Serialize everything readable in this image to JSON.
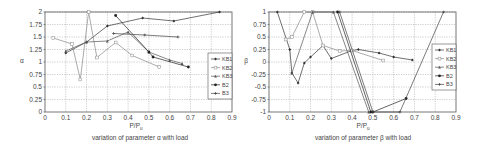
{
  "chart_data": [
    {
      "type": "line",
      "title": "variation of parameter α with load",
      "xlabel": "P/Pu",
      "ylabel": "α",
      "xlim": [
        0,
        0.9
      ],
      "ylim": [
        0,
        2
      ],
      "xticks": [
        "0",
        "0.1",
        "0.2",
        "0.3",
        "0.4",
        "0.5",
        "0.6",
        "0.7",
        "0.8",
        "0.9"
      ],
      "yticks": [
        "0",
        "0.25",
        "0.5",
        "0.75",
        "1",
        "1.25",
        "1.5",
        "1.75",
        "2"
      ],
      "grid": true,
      "legend_position": "right",
      "series": [
        {
          "name": "KB1",
          "color": "#333333",
          "points": [
            [
              0.1,
              1.18
            ],
            [
              0.2,
              1.4
            ],
            [
              0.3,
              1.72
            ],
            [
              0.47,
              1.88
            ],
            [
              0.62,
              1.82
            ],
            [
              0.84,
              2.0
            ]
          ]
        },
        {
          "name": "KB2",
          "color": "#888888",
          "points": [
            [
              0.04,
              1.48
            ],
            [
              0.13,
              1.36
            ],
            [
              0.17,
              0.65
            ],
            [
              0.21,
              2.0
            ],
            [
              0.25,
              1.09
            ],
            [
              0.34,
              1.39
            ],
            [
              0.42,
              1.13
            ],
            [
              0.55,
              0.9
            ]
          ]
        },
        {
          "name": "KB3",
          "color": "#555555",
          "points": [
            [
              0.1,
              1.22
            ],
            [
              0.2,
              1.4
            ],
            [
              0.3,
              1.42
            ],
            [
              0.4,
              1.6
            ],
            [
              0.5,
              1.2
            ],
            [
              0.6,
              1.04
            ],
            [
              0.66,
              0.97
            ]
          ]
        },
        {
          "name": "B2",
          "color": "#222222",
          "points": [
            [
              0.34,
              1.93
            ],
            [
              0.5,
              1.2
            ],
            [
              0.52,
              1.1
            ],
            [
              0.69,
              0.9
            ]
          ]
        },
        {
          "name": "B3",
          "color": "#444444",
          "points": [
            [
              0.33,
              1.57
            ],
            [
              0.48,
              1.54
            ],
            [
              0.64,
              1.5
            ]
          ]
        }
      ]
    },
    {
      "type": "line",
      "title": "variation of parameter β with load",
      "xlabel": "P/Pu",
      "ylabel": "β",
      "xlim": [
        0,
        0.9
      ],
      "ylim": [
        -1,
        1
      ],
      "xticks": [
        "0",
        "0.1",
        "0.2",
        "0.3",
        "0.4",
        "0.5",
        "0.6",
        "0.7",
        "0.8",
        "0.9"
      ],
      "yticks": [
        "-1",
        "-0.75",
        "-0.5",
        "-0.25",
        "0",
        "0.25",
        "0.5",
        "0.75",
        "1"
      ],
      "grid": true,
      "legend_position": "right",
      "series": [
        {
          "name": "KB1",
          "color": "#333333",
          "points": [
            [
              0.04,
              1.0
            ],
            [
              0.1,
              0.25
            ],
            [
              0.11,
              -0.22
            ],
            [
              0.14,
              -0.42
            ],
            [
              0.17,
              -0.02
            ],
            [
              0.2,
              0.1
            ],
            [
              0.26,
              0.33
            ],
            [
              0.3,
              0.07
            ],
            [
              0.4,
              0.23
            ],
            [
              0.43,
              0.25
            ],
            [
              0.53,
              0.18
            ],
            [
              0.6,
              0.1
            ],
            [
              0.69,
              0.04
            ]
          ]
        },
        {
          "name": "KB2",
          "color": "#888888",
          "points": [
            [
              0.08,
              0.45
            ],
            [
              0.11,
              0.5
            ],
            [
              0.17,
              1.0
            ],
            [
              0.21,
              1.0
            ],
            [
              0.26,
              0.33
            ],
            [
              0.34,
              0.22
            ],
            [
              0.4,
              0.23
            ],
            [
              0.55,
              0.03
            ]
          ]
        },
        {
          "name": "KB3",
          "color": "#555555",
          "points": [
            [
              0.11,
              -0.22
            ],
            [
              0.21,
              1.0
            ],
            [
              0.31,
              1.0
            ],
            [
              0.48,
              -1.0
            ]
          ]
        },
        {
          "name": "B2",
          "color": "#222222",
          "points": [
            [
              0.33,
              1.0
            ],
            [
              0.49,
              -1.0
            ],
            [
              0.5,
              -1.0
            ],
            [
              0.66,
              -0.73
            ]
          ]
        },
        {
          "name": "B3",
          "color": "#444444",
          "points": [
            [
              0.34,
              1.0
            ],
            [
              0.5,
              -1.0
            ],
            [
              0.63,
              -1.0
            ],
            [
              0.84,
              1.0
            ]
          ]
        }
      ]
    }
  ],
  "left": {
    "ylabel": "α",
    "xlabel_main": "P/P",
    "xlabel_sub": "u",
    "caption": "variation of parameter α with load",
    "legend": [
      "KB1",
      "KB2",
      "KB3",
      "B2",
      "B3"
    ]
  },
  "right": {
    "ylabel": "β",
    "xlabel_main": "P/P",
    "xlabel_sub": "u",
    "caption": "variation of parameter β with load",
    "legend": [
      "KB1",
      "KB2",
      "KB3",
      "B2",
      "B3"
    ]
  }
}
